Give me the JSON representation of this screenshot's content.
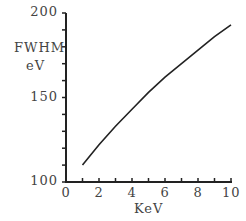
{
  "chart_data": {
    "type": "line",
    "title": "",
    "xlabel": "KeV",
    "ylabel": "FWHM eV",
    "ylabel_lines": [
      "FWHM",
      "eV"
    ],
    "xlim": [
      0,
      10
    ],
    "ylim": [
      100,
      200
    ],
    "x_ticks": [
      "0",
      "2",
      "4",
      "6",
      "8",
      "10"
    ],
    "y_ticks": [
      "100",
      "150",
      "200"
    ],
    "grid": false,
    "legend": null,
    "series": [
      {
        "name": "FWHM",
        "x": [
          1,
          2,
          3,
          4,
          5,
          6,
          7,
          8,
          9,
          10
        ],
        "values": [
          110,
          122,
          133,
          143,
          153,
          162,
          170,
          178,
          186,
          193
        ]
      }
    ],
    "color": "#222222"
  }
}
